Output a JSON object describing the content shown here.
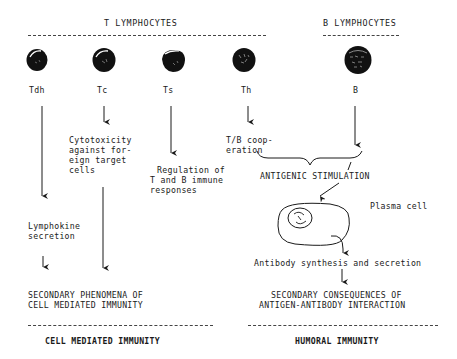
{
  "headers": {
    "t_lymphocytes": "T LYMPHOCYTES",
    "b_lymphocytes": "B LYMPHOCYTES"
  },
  "cells": [
    {
      "id": "tdh",
      "label": "Tdh"
    },
    {
      "id": "tc",
      "label": "Tc"
    },
    {
      "id": "ts",
      "label": "Ts"
    },
    {
      "id": "th",
      "label": "Th"
    },
    {
      "id": "b",
      "label": "B"
    }
  ],
  "functions": {
    "tc": [
      "Cytotoxicity",
      "against for-",
      "eign target",
      "cells"
    ],
    "ts": [
      "Regulation of",
      "T and B immune",
      "responses"
    ],
    "th": [
      "T/B coop-",
      "eration"
    ],
    "tdh": [
      "Lymphokine",
      "secretion"
    ]
  },
  "humoral": {
    "antigenic_stimulation": "ANTIGENIC STIMULATION",
    "plasma_cell": "Plasma cell",
    "antibody": "Antibody synthesis and secretion",
    "secondary": [
      "SECONDARY CONSEQUENCES OF",
      "ANTIGEN-ANTIBODY INTERACTION"
    ]
  },
  "cell_mediated": {
    "secondary": [
      "SECONDARY PHENOMENA OF",
      "CELL MEDIATED IMMUNITY"
    ]
  },
  "footers": {
    "cell_mediated_immunity": "CELL MEDIATED IMMUNITY",
    "humoral_immunity": "HUMORAL IMMUNITY"
  },
  "colors": {
    "ink": "#1a1a1a",
    "background": "#ffffff"
  }
}
